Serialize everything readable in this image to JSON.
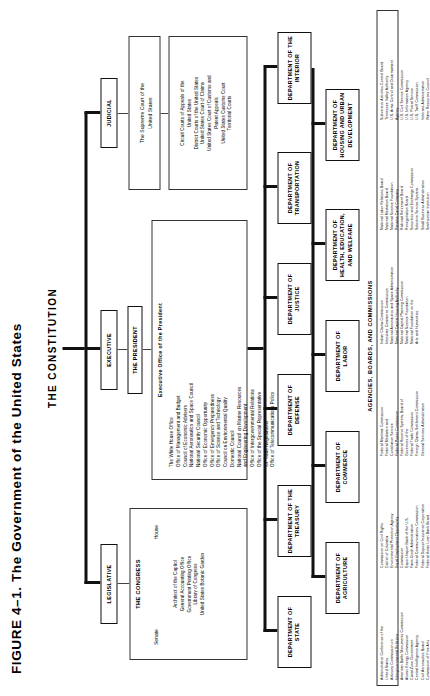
{
  "figure": {
    "title": "FIGURE 4–1. The Government of the United States",
    "root": "THE CONSTITUTION"
  },
  "branches": {
    "legislative": "LEGISLATIVE",
    "executive": "EXECUTIVE",
    "judicial": "JUDICIAL"
  },
  "legislative": {
    "heading": "THE CONGRESS",
    "chambers_left": "Senate",
    "chambers_right": "House",
    "agencies": "Architect of the Capitol\nGeneral Accounting Office\nGovernment Printing Office\nLibrary of Congress\nUnited States Botanic Garden"
  },
  "executive": {
    "president": "THE PRESIDENT",
    "eop_heading": "Executive Office of the President",
    "eop_items": "The White House Office\nOffice of Management and Budget\nCouncil of Economic Advisers\nNational Aeronautics and Space Council\nNational Security Council\nOffice of Economic Opportunity\nOffice of Emergency Preparedness\nOffice of Science and Technology\nCouncil on Environmental Quality\nDomestic Council\nNational Council on Marine Resources\nand Engineering Development\nOffice of Intergovernmental Relations\nOffice of the Special Representative\nfor Trade Negotiations\nOffice of Telecommunications Policy"
  },
  "judicial": {
    "supreme": "The Supreme Court of the\nUnited States",
    "courts": "Circuit Courts of Appeals of the\nUnited States\nDistrict Courts of the United States\nUnited States Court of Claims\nUnited States Court of Customs and\nPatent Appeals\nUnited States Customs Court\nTerritorial Courts"
  },
  "departments": [
    "DEPARTMENT OF\nSTATE",
    "DEPARTMENT OF\nAGRICULTURE",
    "DEPARTMENT OF\nTHE TREASURY",
    "DEPARTMENT OF\nCOMMERCE",
    "DEPARTMENT OF\nDEFENSE",
    "DEPARTMENT OF\nLABOR",
    "DEPARTMENT OF\nJUSTICE",
    "DEPARTMENT OF\nHEALTH, EDUCATION,\nAND WELFARE",
    "DEPARTMENT OF\nTRANSPORTATION",
    "DEPARTMENT OF\nHOUSING AND URBAN\nDEVELOPMENT",
    "DEPARTMENT OF\nTHE INTERIOR"
  ],
  "agencies": {
    "heading": "AGENCIES, BOARDS, AND COMMISSIONS",
    "col1": "Administrative Conference of the\nUnited States\nAdvisory Commission on\nIntergovernmental Relations\nAmerican Battle Monuments Commission\nAtomic Energy Commission\nCanal Zone Government\nCentral Intelligence Agency\nCivil Aeronautics Board\nCommission of Fine Arts",
    "col2": "Commission on Civil Rights\nDistrict of Columbia\nEnvironmental Protection Agency\nEqual Employment Opportunity\nCommission\nExport-Import Bank of the U.S.\nFarm Credit Administration\nFederal Communications Commission\nFederal Deposit Insurance Corporation\nFederal Home Loan Bank Board",
    "col3": "Federal Maritime Commission\nFederal Mediation and\nConciliation Service\nFederal Power Commission\nFederal Reserve System, Board of\nGovernors of the\nFederal Trade Commission\nForeign Claims Settlement Commission\nGeneral Services Administration",
    "col4": "Indian Claims Commission\nInterstate Commerce Commission\nNational Aeronautics and Space Administration\nNational Capital Housing Authority\nNational Capital Planning Commission\nNational Science Foundation\nNational Foundation on the\nArts and Humanities",
    "col5": "National Labor Relations Board\nNational Mediation Board\nNational Science Foundation\nPanama Canal Company\nRailroad Retirement Board\nRenegotiation Board\nSecurities and Exchange Commission\nSelective Service System\nSmall Business Administration\nSmithsonian Institution",
    "col6": "Subversive Activities Control Board\nTennessee Valley Authority\nU.S. Arms Control and Disarmament\nAgency\nU.S. Civil Service Commission\nU.S. Information Agency\nU.S. Postal Service\nU.S. Tariff Commission\nVeterans Administration\nWater Resources Council"
  }
}
